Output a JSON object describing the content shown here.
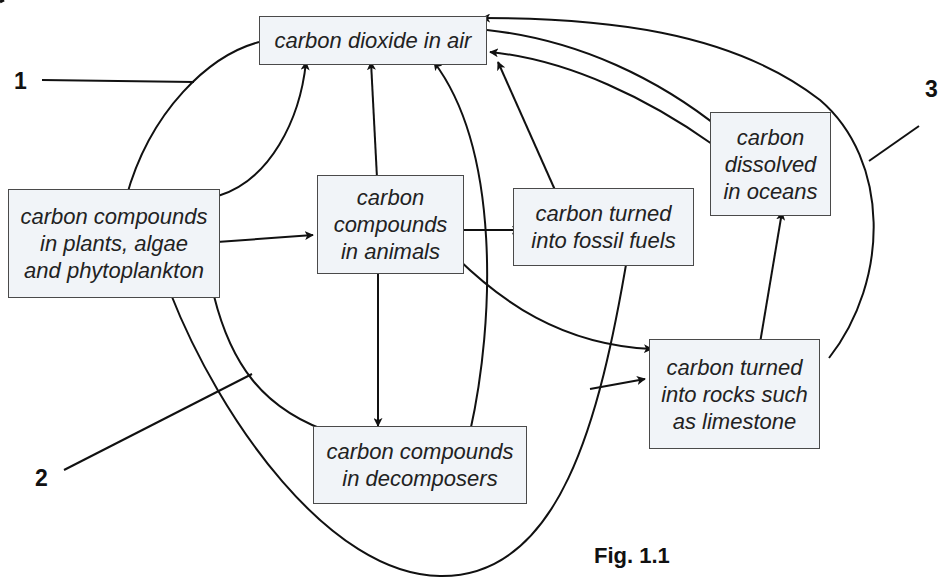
{
  "figure": {
    "caption": "Fig. 1.1",
    "nodes": {
      "co2_air": "carbon dioxide in air",
      "plants": "carbon compounds\nin plants, algae\nand phytoplankton",
      "animals": "carbon\ncompounds\nin animals",
      "fossil": "carbon turned\ninto fossil fuels",
      "oceans": "carbon\ndissolved\nin oceans",
      "rocks": "carbon turned\ninto rocks such\nas limestone",
      "decomposers": "carbon compounds\nin decomposers"
    },
    "labels": {
      "l1": "1",
      "l2": "2",
      "l3": "3"
    },
    "edges": [
      {
        "from": "carbon dioxide in air",
        "to": "carbon compounds in plants, algae and phytoplankton",
        "label": "1"
      },
      {
        "from": "carbon compounds in plants, algae and phytoplankton",
        "to": "carbon dioxide in air"
      },
      {
        "from": "carbon compounds in plants, algae and phytoplankton",
        "to": "carbon compounds in animals"
      },
      {
        "from": "carbon compounds in plants, algae and phytoplankton",
        "to": "carbon compounds in decomposers",
        "label": "2"
      },
      {
        "from": "carbon compounds in plants, algae and phytoplankton",
        "to": "carbon turned into fossil fuels"
      },
      {
        "from": "carbon compounds in animals",
        "to": "carbon dioxide in air"
      },
      {
        "from": "carbon compounds in animals",
        "to": "carbon turned into fossil fuels"
      },
      {
        "from": "carbon compounds in animals",
        "to": "carbon compounds in decomposers"
      },
      {
        "from": "carbon compounds in animals",
        "to": "carbon turned into rocks such as limestone"
      },
      {
        "from": "carbon compounds in decomposers",
        "to": "carbon dioxide in air"
      },
      {
        "from": "carbon turned into fossil fuels",
        "to": "carbon dioxide in air"
      },
      {
        "from": "carbon dioxide in air",
        "to": "carbon dissolved in oceans"
      },
      {
        "from": "carbon dissolved in oceans",
        "to": "carbon dioxide in air"
      },
      {
        "from": "carbon turned into rocks such as limestone",
        "to": "carbon dissolved in oceans"
      },
      {
        "from": "carbon turned into rocks such as limestone",
        "to": "carbon dioxide in air",
        "label": "3"
      },
      {
        "from": "plants curve",
        "to": "carbon turned into rocks such as limestone"
      }
    ]
  }
}
